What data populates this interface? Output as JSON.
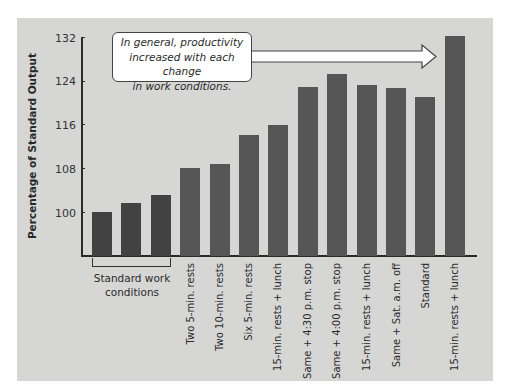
{
  "chart_data": {
    "type": "bar",
    "title": "",
    "xlabel": "",
    "ylabel": "Percentage of Standard Output",
    "ylim": [
      96,
      132
    ],
    "yticks": [
      100,
      108,
      116,
      124,
      132
    ],
    "categories": [
      "Standard work conditions (1)",
      "Standard work conditions (2)",
      "Standard work conditions (3)",
      "Two 5-min. rests",
      "Two 10-min. rests",
      "Six 5-min. rests",
      "15-min. rests + lunch",
      "Same + 4:30 p.m. stop",
      "Same + 4:00 p.m. stop",
      "15-min. rests + lunch",
      "Same + Sat. a.m. off",
      "Standard",
      "15-min. rests + lunch"
    ],
    "values": [
      100,
      101.6,
      103.2,
      108,
      108.8,
      114.1,
      116,
      122.9,
      125.3,
      123.3,
      122.6,
      121.1,
      132.1
    ],
    "group_label": "Standard work conditions",
    "annotation": "In general, productivity increased with each change in work conditions.",
    "grid": false,
    "legend": null
  },
  "axis": {
    "ylabel": "Percentage of Standard Output",
    "ticks": [
      "132",
      "124",
      "116",
      "108",
      "100"
    ]
  },
  "group_label": {
    "line1": "Standard work",
    "line2": "conditions"
  },
  "callout": {
    "line1": "In general, productivity",
    "line2": "increased with each change",
    "line3": "in work conditions."
  },
  "xlabels": [
    "Two 5-min. rests",
    "Two 10-min. rests",
    "Six 5-min. rests",
    "15-min. rests + lunch",
    "Same + 4:30 p.m. stop",
    "Same + 4:00 p.m. stop",
    "15-min. rests + lunch",
    "Same + Sat. a.m. off",
    "Standard",
    "15-min. rests + lunch"
  ],
  "colors": {
    "panel": "#d6d6d5",
    "bar": "#565656",
    "bar_standard": "#424242"
  }
}
